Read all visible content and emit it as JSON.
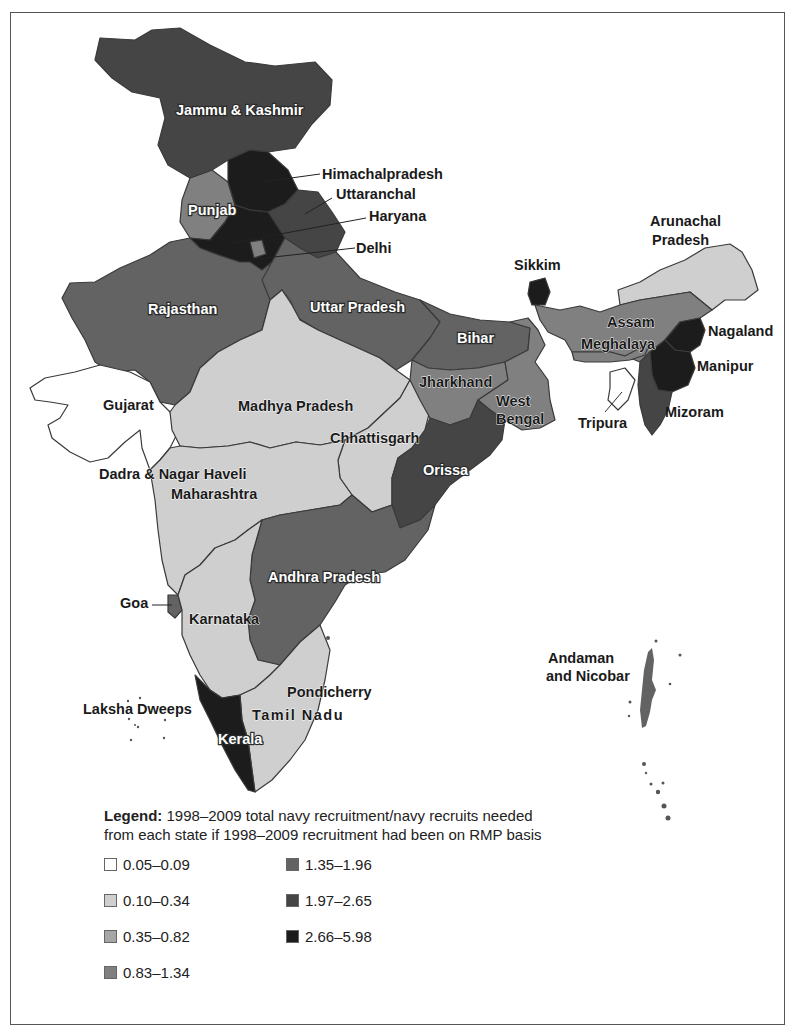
{
  "map": {
    "title": "India – navy recruitment ratio by state (1998–2009)",
    "tone_colors": {
      "c1": "#ffffff",
      "c2": "#cfcfcf",
      "c3": "#a6a6a6",
      "c4": "#808080",
      "c5": "#636363",
      "c6": "#454545",
      "c7": "#1c1c1c"
    },
    "regions": [
      {
        "name": "Jammu & Kashmir",
        "class": "1.97–2.65"
      },
      {
        "name": "Himachalpradesh",
        "class": "2.66–5.98"
      },
      {
        "name": "Punjab",
        "class": "0.83–1.34"
      },
      {
        "name": "Uttaranchal",
        "class": "1.97–2.65"
      },
      {
        "name": "Haryana",
        "class": "2.66–5.98"
      },
      {
        "name": "Delhi",
        "class": "0.83–1.34"
      },
      {
        "name": "Rajasthan",
        "class": "1.35–1.96"
      },
      {
        "name": "Uttar Pradesh",
        "class": "1.35–1.96"
      },
      {
        "name": "Bihar",
        "class": "1.35–1.96"
      },
      {
        "name": "Sikkim",
        "class": "2.66–5.98"
      },
      {
        "name": "Arunachal Pradesh",
        "class": "0.10–0.34"
      },
      {
        "name": "Assam",
        "class": "0.83–1.34"
      },
      {
        "name": "Meghalaya",
        "class": "0.83–1.34"
      },
      {
        "name": "Nagaland",
        "class": "2.66–5.98"
      },
      {
        "name": "Manipur",
        "class": "2.66–5.98"
      },
      {
        "name": "Mizoram",
        "class": "1.97–2.65"
      },
      {
        "name": "Tripura",
        "class": "0.05–0.09"
      },
      {
        "name": "Gujarat",
        "class": "0.05–0.09"
      },
      {
        "name": "Madhya Pradesh",
        "class": "0.10–0.34"
      },
      {
        "name": "Chhattisgarh",
        "class": "0.10–0.34"
      },
      {
        "name": "Jharkhand",
        "class": "0.83–1.34"
      },
      {
        "name": "West Bengal",
        "class": "0.83–1.34"
      },
      {
        "name": "Orissa",
        "class": "1.97–2.65"
      },
      {
        "name": "Dadra & Nagar Haveli",
        "class": "0.10–0.34"
      },
      {
        "name": "Maharashtra",
        "class": "0.10–0.34"
      },
      {
        "name": "Andhra Pradesh",
        "class": "1.35–1.96"
      },
      {
        "name": "Goa",
        "class": "1.35–1.96"
      },
      {
        "name": "Karnataka",
        "class": "0.10–0.34"
      },
      {
        "name": "Kerala",
        "class": "2.66–5.98"
      },
      {
        "name": "Tamil Nadu",
        "class": "0.10–0.34"
      },
      {
        "name": "Pondicherry",
        "class": "0.10–0.34"
      },
      {
        "name": "Laksha Dweeps",
        "class": "0.05–0.09"
      },
      {
        "name": "Andaman and Nicobar",
        "class": "1.35–1.96"
      }
    ],
    "labels": {
      "jk": "Jammu & Kashmir",
      "hp": "Himachalpradesh",
      "uttaranchal": "Uttaranchal",
      "haryana": "Haryana",
      "delhi": "Delhi",
      "punjab": "Punjab",
      "arunachal_1": "Arunachal",
      "arunachal_2": "Pradesh",
      "sikkim": "Sikkim",
      "rajasthan": "Rajasthan",
      "up": "Uttar Pradesh",
      "bihar": "Bihar",
      "assam": "Assam",
      "meghalaya": "Meghalaya",
      "nagaland": "Nagaland",
      "manipur": "Manipur",
      "mizoram": "Mizoram",
      "tripura": "Tripura",
      "gujarat": "Gujarat",
      "mp": "Madhya Pradesh",
      "jharkhand": "Jharkhand",
      "wb_1": "West",
      "wb_2": "Bengal",
      "chhattisgarh": "Chhattisgarh",
      "orissa": "Orissa",
      "dnh": "Dadra & Nagar Haveli",
      "maharashtra": "Maharashtra",
      "ap": "Andhra Pradesh",
      "goa": "Goa",
      "karnataka": "Karnataka",
      "andaman_1": "Andaman",
      "andaman_2": "and Nicobar",
      "pondicherry": "Pondicherry",
      "lakshadweep": "Laksha Dweeps",
      "tamilnadu": "Tamil Nadu",
      "kerala": "Kerala"
    }
  },
  "legend": {
    "title_bold": "Legend:",
    "title_line1": " 1998–2009 total navy recruitment/navy recruits needed",
    "title_line2": "from each state if 1998–2009 recruitment had been on RMP basis",
    "items": [
      {
        "label": "0.05–0.09",
        "color": "#ffffff"
      },
      {
        "label": "0.10–0.34",
        "color": "#cfcfcf"
      },
      {
        "label": "0.35–0.82",
        "color": "#a6a6a6"
      },
      {
        "label": "0.83–1.34",
        "color": "#808080"
      },
      {
        "label": "1.35–1.96",
        "color": "#636363"
      },
      {
        "label": "1.97–2.65",
        "color": "#454545"
      },
      {
        "label": "2.66–5.98",
        "color": "#1c1c1c"
      }
    ]
  }
}
